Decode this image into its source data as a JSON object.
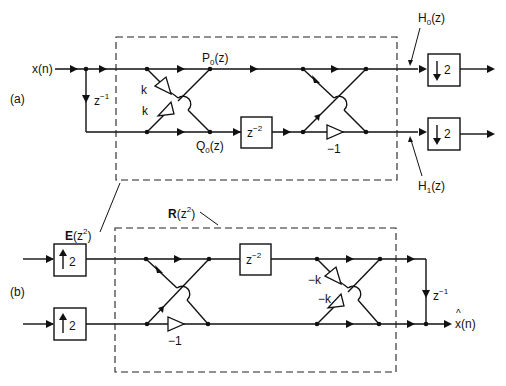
{
  "figure": {
    "part_a": {
      "label": "(a)",
      "input": "x(n)",
      "delay": {
        "base": "z",
        "exp": "−1"
      },
      "block_label": {
        "base": "E",
        "arg_base": "(z",
        "arg_exp": "2",
        "arg_close": ")"
      },
      "node_p0": {
        "base": "P",
        "sub": "0",
        "rest": "(z)"
      },
      "node_q0": {
        "base": "Q",
        "sub": "0",
        "rest": "(z)"
      },
      "gain_k_top": "k",
      "gain_k_bottom": "k",
      "delay_box": {
        "base": "z",
        "exp": "−2"
      },
      "gain_neg1": "−1",
      "out_h0": {
        "base": "H",
        "sub": "0",
        "rest": "(z)"
      },
      "out_h1": {
        "base": "H",
        "sub": "1",
        "rest": "(z)"
      },
      "downsampler_top": "2",
      "downsampler_bottom": "2"
    },
    "part_b": {
      "label": "(b)",
      "block_label": {
        "base": "R",
        "arg_base": "(z",
        "arg_exp": "2",
        "arg_close": ")"
      },
      "upsampler_top": "2",
      "upsampler_bottom": "2",
      "gain_neg1": "−1",
      "delay_box": {
        "base": "z",
        "exp": "−2"
      },
      "gain_negk_top": "−k",
      "gain_negk_bottom": "−k",
      "delay": {
        "base": "z",
        "exp": "−1"
      },
      "output": {
        "hat": "^",
        "text": "x(n)"
      }
    }
  }
}
